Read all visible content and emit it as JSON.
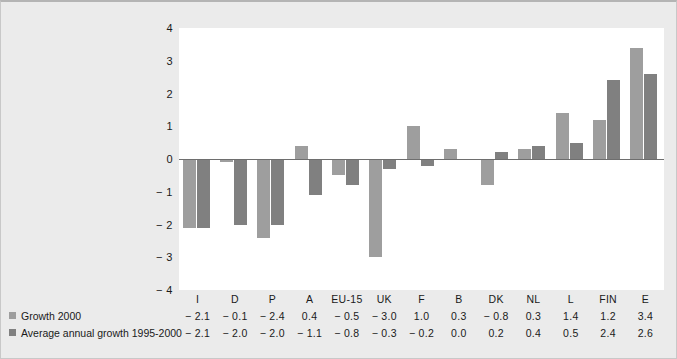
{
  "chart_data": {
    "type": "bar",
    "title": "",
    "subtitle": "",
    "xlabel": "",
    "ylabel": "",
    "ylim": [
      -4,
      4
    ],
    "yticks": [
      "4",
      "3",
      "2",
      "1",
      "0",
      "− 1",
      "− 2",
      "− 3",
      "− 4"
    ],
    "ytick_values": [
      4,
      3,
      2,
      1,
      0,
      -1,
      -2,
      -3,
      -4
    ],
    "grid": false,
    "legend_position": "bottom-left",
    "categories": [
      "I",
      "D",
      "P",
      "A",
      "EU-15",
      "UK",
      "F",
      "B",
      "DK",
      "NL",
      "L",
      "FIN",
      "E"
    ],
    "series": [
      {
        "name": "Growth 2000",
        "color": "#9e9e9e",
        "values": [
          -2.1,
          -0.1,
          -2.4,
          0.4,
          -0.5,
          -3.0,
          1.0,
          0.3,
          -0.8,
          0.3,
          1.4,
          1.2,
          3.4
        ],
        "labels": [
          "− 2.1",
          "− 0.1",
          "− 2.4",
          "0.4",
          "− 0.5",
          "− 3.0",
          "1.0",
          "0.3",
          "− 0.8",
          "0.3",
          "1.4",
          "1.2",
          "3.4"
        ]
      },
      {
        "name": "Average annual growth 1995-2000",
        "color": "#808080",
        "values": [
          -2.1,
          -2.0,
          -2.0,
          -1.1,
          -0.8,
          -0.3,
          -0.2,
          0.0,
          0.2,
          0.4,
          0.5,
          2.4,
          2.6
        ],
        "labels": [
          "− 2.1",
          "− 2.0",
          "− 2.0",
          "− 1.1",
          "− 0.8",
          "− 0.3",
          "− 0.2",
          "0.0",
          "0.2",
          "0.4",
          "0.5",
          "2.4",
          "2.6"
        ]
      }
    ]
  },
  "colors": {
    "background": "#ebebeb",
    "plot_background": "#ffffff",
    "series_1": "#9e9e9e",
    "series_2": "#808080",
    "axis_line": "#6e6e6e",
    "text": "#1a1a1a"
  }
}
